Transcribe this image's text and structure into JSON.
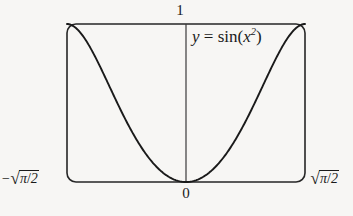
{
  "figure": {
    "kind": "math-function-plot",
    "background_color": "#f7f6f4",
    "ink_color": "#1a1a1a",
    "labels": {
      "y_max": "1",
      "origin": "0",
      "x_min_prefix": "−",
      "x_min_radicand_num": "π",
      "x_min_radicand_den": "2",
      "x_min_text": "−√(π/2)",
      "x_max_radicand_num": "π",
      "x_max_radicand_den": "2",
      "x_max_text": "√(π/2)",
      "equation_lhs": "y",
      "equation_eq": " = ",
      "equation_fn": "sin(",
      "equation_arg_base": "x",
      "equation_arg_exp": "2",
      "equation_close": ")",
      "equation_text": "y = sin(x²)"
    },
    "frame": {
      "x": 67,
      "y": 24,
      "width": 238,
      "height": 158,
      "corner_radius": 9,
      "stroke_width": 1.6,
      "stroke_color": "#262626"
    },
    "y_axis": {
      "x": 186,
      "top": 24,
      "bottom": 182,
      "stroke_width": 1.2,
      "stroke_color": "#3a3a3a"
    }
  },
  "chart_data": {
    "type": "line",
    "title": "",
    "subtitle": "",
    "xlabel": "",
    "ylabel": "",
    "function": "y = sin(x^2)",
    "legend": [
      "y = sin(x²)"
    ],
    "legend_position": "inside-top-right",
    "grid": false,
    "xlim": [
      -1.2533141373155003,
      1.2533141373155003
    ],
    "ylim": [
      0,
      1
    ],
    "xtick_labels": [
      "−√(π/2)",
      "0",
      "√(π/2)"
    ],
    "xtick_values": [
      -1.2533141373155003,
      0,
      1.2533141373155003
    ],
    "ytick_labels": [
      "0",
      "1"
    ],
    "ytick_values": [
      0,
      1
    ],
    "annotations": [
      {
        "text": "y = sin(x²)",
        "x": 0.1,
        "y": 0.93
      }
    ],
    "stroke_color": "#1a1a1a",
    "stroke_width": 1.9,
    "x": [
      -1.2533141373155,
      -1.2032,
      -1.1531,
      -1.103,
      -1.0529,
      -1.0028,
      -0.9526,
      -0.9025,
      -0.8524,
      -0.8023,
      -0.7522,
      -0.7021,
      -0.652,
      -0.6018,
      -0.5517,
      -0.5016,
      -0.4515,
      -0.4014,
      -0.3513,
      -0.3011,
      -0.251,
      -0.2009,
      -0.1508,
      -0.1007,
      -0.0506,
      0,
      0.0506,
      0.1007,
      0.1508,
      0.2009,
      0.251,
      0.3011,
      0.3513,
      0.4014,
      0.4515,
      0.5016,
      0.5517,
      0.6018,
      0.652,
      0.7021,
      0.7522,
      0.8023,
      0.8524,
      0.9025,
      0.9526,
      1.0028,
      1.0529,
      1.103,
      1.1531,
      1.2032,
      1.2533141373155
    ],
    "y": [
      1.0,
      0.9874,
      0.9496,
      0.8889,
      0.8088,
      0.7137,
      0.6085,
      0.4984,
      0.3881,
      0.2818,
      0.1832,
      0.0952,
      0.0198,
      0.0,
      0.0,
      0.0,
      0.0,
      0.0,
      0.0,
      0.0,
      0.0,
      0.0,
      0.0,
      0.0,
      0.0,
      0.0,
      0.0,
      0.0,
      0.0,
      0.0,
      0.0,
      0.0,
      0.0,
      0.0,
      0.0,
      0.0,
      0.0,
      0.0,
      0.0198,
      0.0952,
      0.1832,
      0.2818,
      0.3881,
      0.4984,
      0.6085,
      0.7137,
      0.8088,
      0.8889,
      0.9496,
      0.9874,
      1.0
    ]
  }
}
